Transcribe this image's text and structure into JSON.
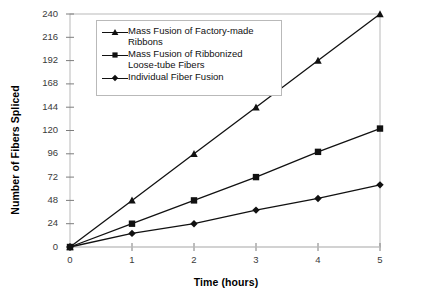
{
  "chart_data": {
    "type": "line",
    "title": "",
    "xlabel": "Time (hours)",
    "ylabel": "Number of Fibers Spliced",
    "x": [
      0,
      1,
      2,
      3,
      4,
      5
    ],
    "xlim": [
      0,
      5
    ],
    "ylim": [
      0,
      240
    ],
    "xticks": [
      "0",
      "1",
      "2",
      "3",
      "4",
      "5"
    ],
    "yticks": [
      "0",
      "24",
      "48",
      "72",
      "96",
      "120",
      "144",
      "168",
      "192",
      "216",
      "240"
    ],
    "grid": false,
    "legend_position": "upper-left-inside",
    "series": [
      {
        "name": "Mass Fusion of Factory-made Ribbons",
        "marker": "triangle",
        "color": "#111111",
        "values": [
          0,
          48,
          96,
          144,
          192,
          240
        ]
      },
      {
        "name": "Mass Fusion of Ribbonized Loose-tube Fibers",
        "marker": "square",
        "color": "#111111",
        "values": [
          0,
          24,
          48,
          72,
          98,
          122
        ]
      },
      {
        "name": "Individual Fiber Fusion",
        "marker": "diamond",
        "color": "#111111",
        "values": [
          0,
          14,
          24,
          38,
          50,
          64
        ]
      }
    ]
  },
  "legend": {
    "entries": [
      {
        "line1": "Mass Fusion of Factory-made",
        "line2": "Ribbons"
      },
      {
        "line1": "Mass Fusion of Ribbonized",
        "line2": "Loose-tube Fibers"
      },
      {
        "line1": "Individual Fiber Fusion",
        "line2": ""
      }
    ]
  },
  "axes": {
    "y_title": "Number of Fibers Spliced",
    "x_title": "Time (hours)",
    "y_ticks": [
      "240",
      "216",
      "192",
      "168",
      "144",
      "120",
      "96",
      "72",
      "48",
      "24",
      "0"
    ],
    "x_ticks": [
      "0",
      "1",
      "2",
      "3",
      "4",
      "5"
    ]
  },
  "colors": {
    "frame": "#b9b9b9",
    "series": "#111111",
    "tick_text": "#3a3a3a",
    "background": "#ffffff"
  }
}
